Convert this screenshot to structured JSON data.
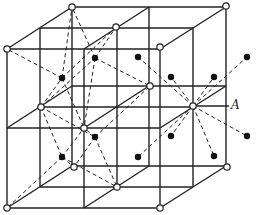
{
  "diagram": {
    "label_A": "A",
    "colors": {
      "line": "#222222",
      "background": "#ffffff",
      "dot": "#111111",
      "circle_fill": "#ffffff"
    },
    "frame": {
      "planes": [
        {
          "name": "front",
          "xs": [
            7,
            84,
            160
          ],
          "ys": [
            49,
            128,
            208
          ]
        },
        {
          "name": "middle",
          "xs": [
            40,
            117,
            193
          ],
          "ys": [
            28,
            107,
            187
          ]
        },
        {
          "name": "back",
          "xs": [
            72,
            149,
            226
          ],
          "ys": [
            7,
            86,
            166
          ]
        }
      ]
    },
    "open_circles": [
      [
        72,
        7
      ],
      [
        226,
        6
      ],
      [
        7,
        49
      ],
      [
        116,
        27
      ],
      [
        160,
        47
      ],
      [
        41,
        107
      ],
      [
        150,
        86
      ],
      [
        193,
        106
      ],
      [
        84,
        128
      ],
      [
        74,
        167
      ],
      [
        117,
        187
      ],
      [
        7,
        208
      ],
      [
        160,
        208
      ],
      [
        227,
        167
      ]
    ],
    "solid_dots": [
      [
        62,
        78
      ],
      [
        95,
        58
      ],
      [
        62,
        157
      ],
      [
        95,
        137
      ],
      [
        138,
        57
      ],
      [
        171,
        77
      ],
      [
        214,
        77
      ],
      [
        247,
        57
      ],
      [
        171,
        136
      ],
      [
        138,
        157
      ],
      [
        214,
        156
      ],
      [
        247,
        136
      ]
    ],
    "dashed_from_center_left": [
      41,
      107
    ],
    "dashed_from_center_right": [
      193,
      106
    ]
  }
}
